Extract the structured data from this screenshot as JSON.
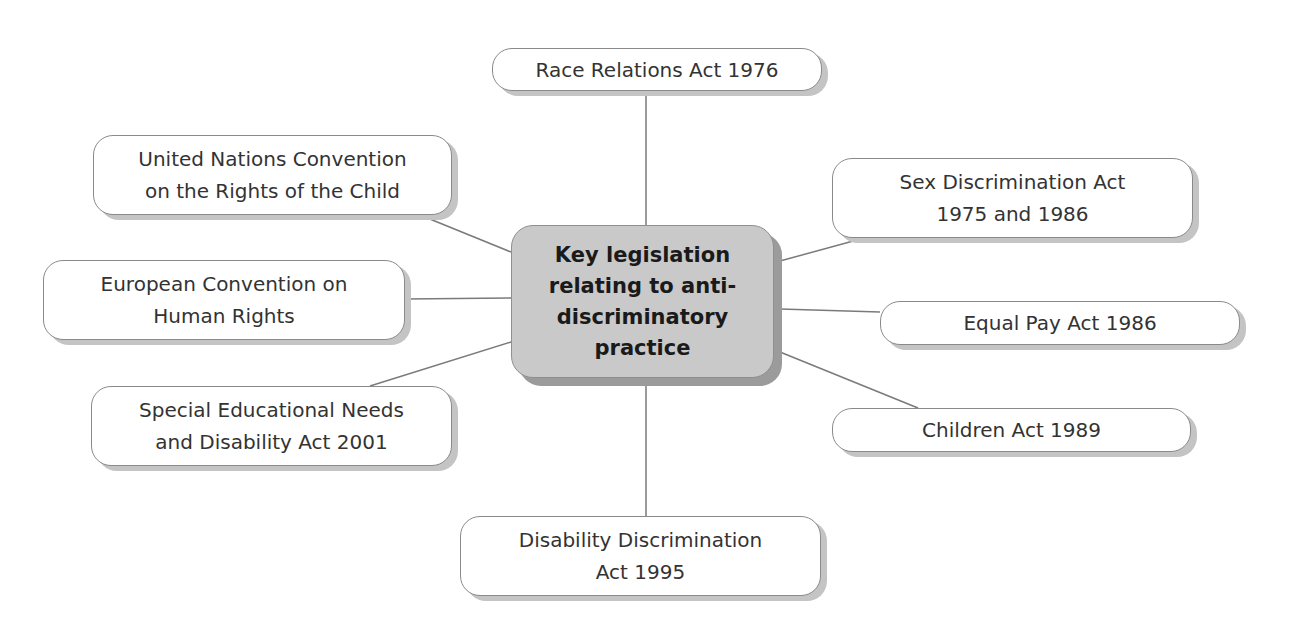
{
  "diagram": {
    "type": "mind-map",
    "center": {
      "label": "Key legislation\nrelating to anti-\ndiscriminatory\npractice"
    },
    "nodes": [
      {
        "id": "race-relations",
        "label": "Race Relations Act 1976"
      },
      {
        "id": "uncrc",
        "label": "United Nations Convention\non the Rights of the Child"
      },
      {
        "id": "echr",
        "label": "European Convention on\nHuman Rights"
      },
      {
        "id": "send",
        "label": "Special Educational Needs\nand Disability Act 2001"
      },
      {
        "id": "disability-discrimination",
        "label": "Disability Discrimination\nAct 1995"
      },
      {
        "id": "sex-discrimination",
        "label": "Sex Discrimination Act\n1975 and 1986"
      },
      {
        "id": "equal-pay",
        "label": "Equal Pay Act 1986"
      },
      {
        "id": "children-act",
        "label": "Children Act 1989"
      }
    ],
    "colors": {
      "center_fill": "#c9c9c9",
      "node_fill": "#ffffff",
      "line": "#7a7a7a",
      "shadow": "#c4c4c4"
    }
  }
}
